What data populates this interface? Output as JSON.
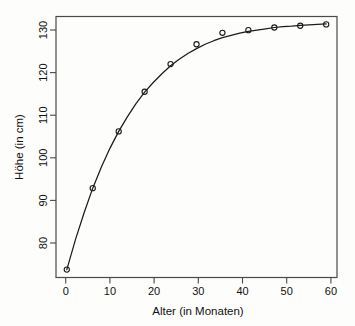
{
  "chart_data": {
    "type": "scatter",
    "title": "",
    "subtitle": "",
    "xlabel": "Alter (in Monaten)",
    "ylabel": "Höhe (in cm)",
    "xlim": [
      -2.5,
      62.5
    ],
    "ylim": [
      74.2,
      133.5
    ],
    "xticks": [
      0,
      10,
      20,
      30,
      40,
      50,
      60
    ],
    "yticks": [
      80,
      90,
      100,
      110,
      120,
      130
    ],
    "xticklabels": [
      "0",
      "10",
      "20",
      "30",
      "40",
      "50",
      "60"
    ],
    "yticklabels": [
      "80",
      "90",
      "100",
      "110",
      "120",
      "130"
    ],
    "grid": false,
    "legend": null,
    "legend_position": "none",
    "marker": "open-circle",
    "series": [
      {
        "name": "Messpunkte",
        "type": "scatter",
        "marker": "open-circle",
        "color": "#1b1b1b",
        "x": [
          0,
          6,
          12,
          18,
          24,
          30,
          36,
          42,
          48,
          54,
          60
        ],
        "y": [
          76.0,
          94.5,
          107.4,
          116.4,
          122.7,
          127.2,
          129.8,
          130.4,
          131.0,
          131.4,
          131.7
        ]
      },
      {
        "name": "Angepasste Kurve",
        "type": "line",
        "color": "#1b1b1b",
        "x": [
          0,
          2,
          4,
          6,
          8,
          10,
          12,
          14,
          16,
          18,
          20,
          22,
          24,
          26,
          28,
          30,
          32,
          34,
          36,
          38,
          40,
          42,
          44,
          46,
          48,
          50,
          52,
          54,
          56,
          58,
          60
        ],
        "y": [
          76.0,
          82.8,
          88.9,
          94.5,
          99.3,
          103.6,
          107.4,
          110.7,
          113.7,
          116.3,
          118.5,
          120.5,
          122.3,
          123.8,
          125.1,
          126.2,
          127.2,
          128.0,
          128.7,
          129.2,
          129.7,
          130.1,
          130.4,
          130.7,
          131.0,
          131.2,
          131.3,
          131.5,
          131.6,
          131.7,
          131.8
        ]
      }
    ]
  },
  "figure": {
    "background_color": "#fdfdfc",
    "foreground_color": "#1b1b1b",
    "frame_color": "#4a4a4a"
  }
}
